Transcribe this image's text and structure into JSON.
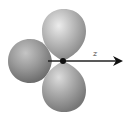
{
  "diagram": {
    "type": "orbital-lobes",
    "lobe_count": 3,
    "axis": {
      "label": "z",
      "direction": "right"
    },
    "colors": {
      "lobe_highlight": "#e6e6e6",
      "lobe_mid": "#b4b4b4",
      "lobe_shadow": "#7a7a7a",
      "left_lobe_mid": "#9a9a9a",
      "axis_line": "#222222",
      "nucleus": "#111111",
      "background": "#ffffff"
    },
    "lobes": [
      {
        "name": "top",
        "cx": 64,
        "cy": 34,
        "rx": 22,
        "ry": 25
      },
      {
        "name": "left",
        "cx": 30,
        "cy": 61,
        "rx": 22,
        "ry": 22
      },
      {
        "name": "bottom",
        "cx": 64,
        "cy": 87,
        "rx": 22,
        "ry": 25
      }
    ],
    "nucleus": {
      "cx": 63,
      "cy": 61,
      "r": 3
    }
  }
}
